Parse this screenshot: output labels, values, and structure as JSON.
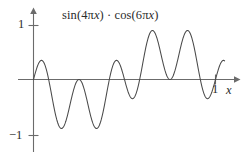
{
  "figure": {
    "title": "sin(4πx) · cos(6πx)",
    "title_parts": {
      "sin_open": "sin(4",
      "pi1": "π",
      "var1": "x",
      "mid": ") · cos(6",
      "pi2": "π",
      "var2": "x",
      "close": ")"
    },
    "background_color": "#ffffff",
    "axis_color": "#6b6b6b",
    "curve_color": "#4a4a4a",
    "text_color": "#2b2b2b"
  },
  "axes": {
    "y_axis": {
      "label": "",
      "ticks": [
        {
          "name": "y-tick-one",
          "label": "1",
          "value": 1
        },
        {
          "name": "y-tick-minus-one",
          "label": "−1",
          "value": -1
        }
      ],
      "range": [
        -1.35,
        1.35
      ],
      "has_arrow": true
    },
    "x_axis": {
      "label": "x",
      "ticks": [
        {
          "name": "x-tick-one",
          "label": "1",
          "value": 1
        }
      ],
      "range": [
        -0.05,
        1.12
      ],
      "has_arrow": true
    }
  },
  "chart_data": {
    "type": "line",
    "title": "sin(4πx) · cos(6πx)",
    "xlabel": "x",
    "ylabel": "",
    "xlim": [
      -0.05,
      1.12
    ],
    "ylim": [
      -1.35,
      1.35
    ],
    "grid": false,
    "legend": null,
    "function": "sin(4*pi*x) * cos(6*pi*x)",
    "x_tick_values": [
      1
    ],
    "y_tick_values": [
      1,
      -1
    ],
    "domain_plotted": [
      0.0,
      1.05
    ],
    "samples": 420,
    "series": [
      {
        "name": "sin(4πx)·cos(6πx)",
        "color": "#4a4a4a",
        "x": [
          0.0,
          0.05,
          0.1,
          0.15,
          0.2,
          0.25,
          0.3,
          0.35,
          0.4,
          0.45,
          0.5,
          0.55,
          0.6,
          0.65,
          0.7,
          0.75,
          0.8,
          0.85,
          0.9,
          0.95,
          1.0,
          1.05
        ],
        "values": [
          0.0,
          0.364,
          0.427,
          0.0,
          -0.64,
          -0.951,
          -0.64,
          0.0,
          0.427,
          0.364,
          0.0,
          -0.364,
          -0.427,
          0.0,
          0.64,
          0.951,
          0.64,
          0.0,
          -0.427,
          -0.364,
          0.0,
          0.364
        ]
      }
    ],
    "key_features": {
      "zeros": [
        0.0,
        0.1667,
        0.25,
        0.3333,
        0.5,
        0.6667,
        0.75,
        0.8333,
        1.0
      ],
      "local_maxima": [
        {
          "x": 0.1,
          "y": 0.43
        },
        {
          "x": 0.31,
          "y": 0.18
        },
        {
          "x": 0.44,
          "y": 0.43
        },
        {
          "x": 0.72,
          "y": 0.99
        },
        {
          "x": 0.9,
          "y": 0.99
        }
      ],
      "local_minima": [
        {
          "x": 0.22,
          "y": -0.96
        },
        {
          "x": 0.4,
          "y": -0.96
        },
        {
          "x": 0.6,
          "y": -0.43
        },
        {
          "x": 0.81,
          "y": -0.18
        },
        {
          "x": 1.03,
          "y": -0.5
        }
      ]
    }
  }
}
